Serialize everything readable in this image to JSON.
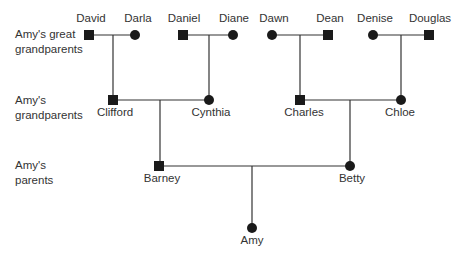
{
  "generations": [
    {
      "label_line1": "Amy's great",
      "label_line2": "grandparents"
    },
    {
      "label_line1": "Amy's",
      "label_line2": "grandparents"
    },
    {
      "label_line1": "Amy's",
      "label_line2": "parents"
    }
  ],
  "people": {
    "david": {
      "name": "David",
      "sex": "male"
    },
    "darla": {
      "name": "Darla",
      "sex": "female"
    },
    "daniel": {
      "name": "Daniel",
      "sex": "male"
    },
    "diane": {
      "name": "Diane",
      "sex": "female"
    },
    "dawn": {
      "name": "Dawn",
      "sex": "female"
    },
    "dean": {
      "name": "Dean",
      "sex": "male"
    },
    "denise": {
      "name": "Denise",
      "sex": "female"
    },
    "douglas": {
      "name": "Douglas",
      "sex": "male"
    },
    "clifford": {
      "name": "Clifford",
      "sex": "male"
    },
    "cynthia": {
      "name": "Cynthia",
      "sex": "female"
    },
    "charles": {
      "name": "Charles",
      "sex": "male"
    },
    "chloe": {
      "name": "Chloe",
      "sex": "female"
    },
    "barney": {
      "name": "Barney",
      "sex": "male"
    },
    "betty": {
      "name": "Betty",
      "sex": "female"
    },
    "amy": {
      "name": "Amy",
      "sex": "female"
    }
  },
  "legend": {
    "square": "male",
    "circle": "female"
  },
  "colors": {
    "line": "#333333",
    "symbol": "#1a1a1a"
  }
}
